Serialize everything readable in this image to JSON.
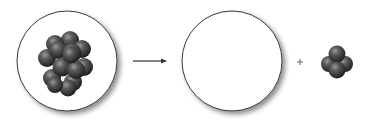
{
  "diagram": {
    "type": "nuclear-decay",
    "colors": {
      "background": "#ffffff",
      "circle_stroke": "#3a3a3a",
      "shadow": "#bdbdbd",
      "nucleon_dark": "#2e2e2e",
      "nucleon_mid": "#555555",
      "nucleon_highlight": "#8a8a8a",
      "arrow": "#333333",
      "plus": "#555555"
    },
    "parent_nucleus": {
      "cx": 67,
      "cy": 61,
      "r": 50,
      "nucleon_count": 14
    },
    "arrow": {
      "x1": 133,
      "x2": 167,
      "y": 61
    },
    "daughter_nucleus": {
      "cx": 232,
      "cy": 61,
      "r": 50,
      "nucleon_count": 0
    },
    "plus_sign": {
      "x": 300,
      "y": 62,
      "symbol": "+"
    },
    "emitted_particle": {
      "cx": 337,
      "cy": 62,
      "nucleon_count": 4
    }
  }
}
